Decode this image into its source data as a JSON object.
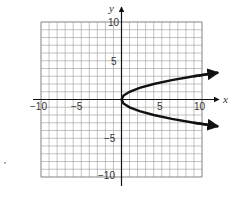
{
  "chart_data": {
    "type": "line",
    "title": "",
    "xlabel": "x",
    "ylabel": "y",
    "xlim": [
      -10,
      10
    ],
    "ylim": [
      -10,
      10
    ],
    "grid": true,
    "grid_step": 1,
    "x_ticks": [
      -10,
      -5,
      5,
      10
    ],
    "y_ticks": [
      10,
      5,
      -5,
      -10
    ],
    "x_tick_labels": [
      "−10",
      "−5",
      "5",
      "10"
    ],
    "y_tick_labels": [
      "10",
      "5",
      "−5",
      "−10"
    ],
    "series": [
      {
        "name": "x = y^2",
        "equation": "x = y^2",
        "vertex": [
          0,
          0
        ],
        "opens": "right",
        "arrows_at_ends": true,
        "x": [
          12,
          9,
          6.25,
          4,
          2.25,
          1,
          0.25,
          0,
          0.25,
          1,
          2.25,
          4,
          6.25,
          9,
          12
        ],
        "y": [
          3.46,
          3,
          2.5,
          2,
          1.5,
          1,
          0.5,
          0,
          -0.5,
          -1,
          -1.5,
          -2,
          -2.5,
          -3,
          -3.46
        ]
      }
    ],
    "legend": null
  },
  "labels": {
    "x_axis": "x",
    "y_axis": "y",
    "x_ticks": [
      "−10",
      "−5",
      "5",
      "10"
    ],
    "y_ticks": [
      "10",
      "5",
      "−5",
      "−10"
    ]
  }
}
